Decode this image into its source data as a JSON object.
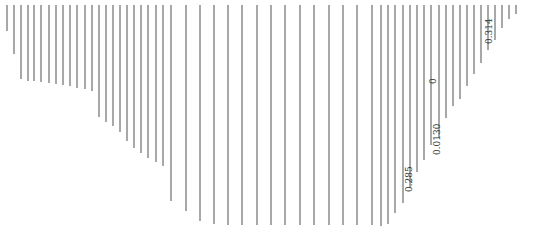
{
  "diagram": {
    "stroke_color": "#6e6e6e",
    "stroke_width": 1.2,
    "background": "#ffffff",
    "top_y": 5,
    "lines": [
      {
        "x": 7,
        "y2": 31
      },
      {
        "x": 14,
        "y2": 54
      },
      {
        "x": 21,
        "y2": 79
      },
      {
        "x": 28,
        "y2": 81
      },
      {
        "x": 34,
        "y2": 81
      },
      {
        "x": 41,
        "y2": 82
      },
      {
        "x": 49,
        "y2": 83
      },
      {
        "x": 56,
        "y2": 84
      },
      {
        "x": 63,
        "y2": 85
      },
      {
        "x": 70,
        "y2": 86
      },
      {
        "x": 77,
        "y2": 88
      },
      {
        "x": 85,
        "y2": 89
      },
      {
        "x": 92,
        "y2": 91
      },
      {
        "x": 99,
        "y2": 117
      },
      {
        "x": 106,
        "y2": 122
      },
      {
        "x": 113,
        "y2": 126
      },
      {
        "x": 120,
        "y2": 132
      },
      {
        "x": 127,
        "y2": 141
      },
      {
        "x": 134,
        "y2": 148
      },
      {
        "x": 141,
        "y2": 153
      },
      {
        "x": 148,
        "y2": 158
      },
      {
        "x": 156,
        "y2": 162
      },
      {
        "x": 163,
        "y2": 166
      },
      {
        "x": 171,
        "y2": 201
      },
      {
        "x": 186,
        "y2": 211
      },
      {
        "x": 200,
        "y2": 221
      },
      {
        "x": 214,
        "y2": 224
      },
      {
        "x": 228,
        "y2": 225
      },
      {
        "x": 242,
        "y2": 225
      },
      {
        "x": 257,
        "y2": 225
      },
      {
        "x": 271,
        "y2": 225
      },
      {
        "x": 285,
        "y2": 225
      },
      {
        "x": 300,
        "y2": 225
      },
      {
        "x": 314,
        "y2": 225
      },
      {
        "x": 329,
        "y2": 225
      },
      {
        "x": 343,
        "y2": 225
      },
      {
        "x": 357,
        "y2": 225
      },
      {
        "x": 372,
        "y2": 225
      },
      {
        "x": 381,
        "y2": 226
      },
      {
        "x": 388,
        "y2": 224
      },
      {
        "x": 395,
        "y2": 213
      },
      {
        "x": 403,
        "y2": 203
      },
      {
        "x": 410,
        "y2": 188
      },
      {
        "x": 417,
        "y2": 172
      },
      {
        "x": 424,
        "y2": 160
      },
      {
        "x": 431,
        "y2": 145
      },
      {
        "x": 439,
        "y2": 138
      },
      {
        "x": 446,
        "y2": 118
      },
      {
        "x": 453,
        "y2": 106
      },
      {
        "x": 460,
        "y2": 99
      },
      {
        "x": 467,
        "y2": 86
      },
      {
        "x": 474,
        "y2": 74
      },
      {
        "x": 481,
        "y2": 63
      },
      {
        "x": 488,
        "y2": 50
      },
      {
        "x": 495,
        "y2": 40
      },
      {
        "x": 502,
        "y2": 28
      },
      {
        "x": 509,
        "y2": 19
      },
      {
        "x": 516,
        "y2": 14
      }
    ],
    "labels": [
      {
        "text": "0.314",
        "x": 485,
        "y": 44
      },
      {
        "text": "0",
        "x": 429,
        "y": 84
      },
      {
        "text": "0.0130",
        "x": 433,
        "y": 155
      },
      {
        "text": "0.285",
        "x": 405,
        "y": 192
      }
    ]
  }
}
